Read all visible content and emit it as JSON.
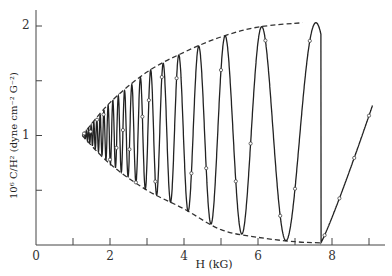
{
  "chart_data": {
    "type": "line",
    "title": "",
    "xlabel": "H (kG)",
    "ylabel": "10⁶ C/H² (dyne cm⁻² G⁻²)",
    "xlim": [
      0,
      9.5
    ],
    "ylim": [
      0,
      2.2
    ],
    "x_ticks": [
      0,
      2,
      4,
      6,
      8
    ],
    "x_minor_ticks": [
      1,
      3,
      5,
      7,
      9
    ],
    "y_ticks": [
      1,
      2
    ],
    "y_minor_ticks": [
      0.5,
      1.5
    ],
    "grid": false,
    "legend": null,
    "series": [
      {
        "name": "oscillation (data points with fitted curve)",
        "style": "solid line with open circle markers",
        "extrema": [
          {
            "H": 1.25,
            "value": 1.0
          },
          {
            "H": 2.9,
            "value": 0.52
          },
          {
            "H": 3.2,
            "value": 1.63
          },
          {
            "H": 3.8,
            "value": 0.37
          },
          {
            "H": 4.2,
            "value": 1.78
          },
          {
            "H": 5.0,
            "value": 0.13
          },
          {
            "H": 6.1,
            "value": 2.0
          },
          {
            "H": 7.7,
            "value": 0.02
          },
          {
            "H": 9.1,
            "value": 1.28
          }
        ]
      },
      {
        "name": "upper envelope",
        "style": "dashed",
        "x": [
          1.25,
          2.0,
          3.0,
          4.0,
          5.0,
          6.0,
          7.2
        ],
        "values": [
          1.0,
          1.3,
          1.58,
          1.76,
          1.9,
          1.99,
          2.03
        ]
      },
      {
        "name": "lower envelope",
        "style": "dashed",
        "x": [
          1.25,
          2.0,
          3.0,
          4.0,
          5.0,
          6.0,
          7.0,
          7.7
        ],
        "values": [
          1.0,
          0.74,
          0.5,
          0.33,
          0.14,
          0.07,
          0.03,
          0.02
        ]
      }
    ]
  },
  "axes": {
    "x_tick_labels": [
      "0",
      "2",
      "4",
      "6",
      "8"
    ],
    "y_tick_labels": [
      "1",
      "2"
    ],
    "xlabel": "H (kG)",
    "ylabel": "10⁶ C/H² (dyne cm⁻² G⁻²)"
  }
}
